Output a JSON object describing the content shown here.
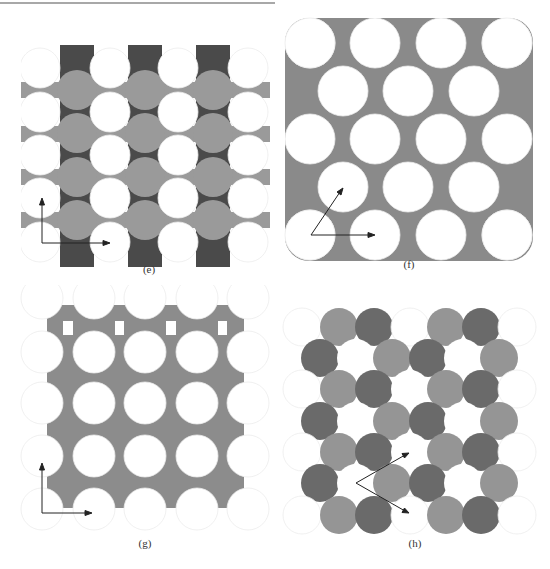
{
  "figure": {
    "panels": [
      {
        "id": "e",
        "label": "(e)",
        "description": "square lattice, white circles with gray interstitial circles and dark caps",
        "colors": {
          "white": "#ffffff",
          "mid": "#9a9a9a",
          "dark": "#4a4a4a",
          "outline": "#e6e6e6"
        },
        "arrows": [
          "up",
          "right"
        ]
      },
      {
        "id": "f",
        "label": "(f)",
        "description": "centered rectangular lattice of white circles on gray background",
        "colors": {
          "white": "#ffffff",
          "mid": "#8a8a8a",
          "outline": "#e6e6e6"
        },
        "arrows": [
          "up-right",
          "right"
        ]
      },
      {
        "id": "g",
        "label": "(g)",
        "description": "square lattice of white circles with gray concave-square interstitials",
        "colors": {
          "white": "#ffffff",
          "mid": "#8c8c8c",
          "outline": "#e6e6e6"
        },
        "arrows": [
          "up",
          "right"
        ]
      },
      {
        "id": "h",
        "label": "(h)",
        "description": "hexagonal packing with three-color polygonal tiles",
        "colors": {
          "white": "#ffffff",
          "mid": "#959595",
          "dark": "#6a6a6a",
          "outline": "#e6e6e6"
        },
        "arrows": [
          "up-right",
          "down-right"
        ]
      }
    ]
  }
}
